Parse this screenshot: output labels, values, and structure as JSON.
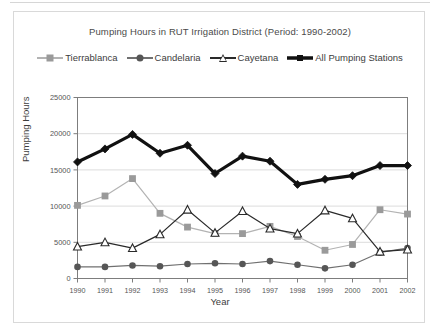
{
  "chart_data": {
    "type": "line",
    "title": "Pumping Hours in RUT Irrigation District (Period: 1990-2002)",
    "xlabel": "Year",
    "ylabel": "Pumping Hours",
    "categories": [
      "1990",
      "1991",
      "1992",
      "1993",
      "1994",
      "1995",
      "1996",
      "1997",
      "1998",
      "1999",
      "2000",
      "2001",
      "2002"
    ],
    "x": [
      1990,
      1991,
      1992,
      1993,
      1994,
      1995,
      1996,
      1997,
      1998,
      1999,
      2000,
      2001,
      2002
    ],
    "ylim": [
      0,
      25000
    ],
    "yticks": [
      "0",
      "5000",
      "10000",
      "15000",
      "20000",
      "25000"
    ],
    "ytick_values": [
      0,
      5000,
      10000,
      15000,
      20000,
      25000
    ],
    "grid": "horizontal",
    "legend_position": "top",
    "series": [
      {
        "name": "Tierrablanca",
        "marker": "square",
        "color": "#9a9a9a",
        "line_color": "#b3b3b3",
        "values": [
          10100,
          11400,
          13800,
          9000,
          7100,
          6200,
          6200,
          7200,
          5800,
          3900,
          4700,
          9500,
          8900
        ]
      },
      {
        "name": "Candelaria",
        "marker": "circle",
        "color": "#565656",
        "line_color": "#707070",
        "values": [
          1600,
          1600,
          1800,
          1700,
          2000,
          2100,
          2000,
          2400,
          1900,
          1400,
          1900,
          3600,
          4200
        ]
      },
      {
        "name": "Cayetana",
        "marker": "triangle-open",
        "color": "#2a2a2a",
        "line_color": "#2a2a2a",
        "values": [
          4400,
          5000,
          4200,
          6100,
          9500,
          6300,
          9300,
          6900,
          6200,
          9400,
          8300,
          3700,
          4000
        ]
      },
      {
        "name": "All Pumping Stations",
        "marker": "diamond",
        "color": "#111111",
        "line_color": "#111111",
        "values": [
          16100,
          17900,
          19900,
          17300,
          18400,
          14500,
          16900,
          16200,
          13000,
          13700,
          14200,
          15600,
          15600
        ]
      }
    ]
  },
  "legend": {
    "items": [
      {
        "label": "Tierrablanca"
      },
      {
        "label": "Candelaria"
      },
      {
        "label": "Cayetana"
      },
      {
        "label": "All Pumping Stations"
      }
    ]
  }
}
